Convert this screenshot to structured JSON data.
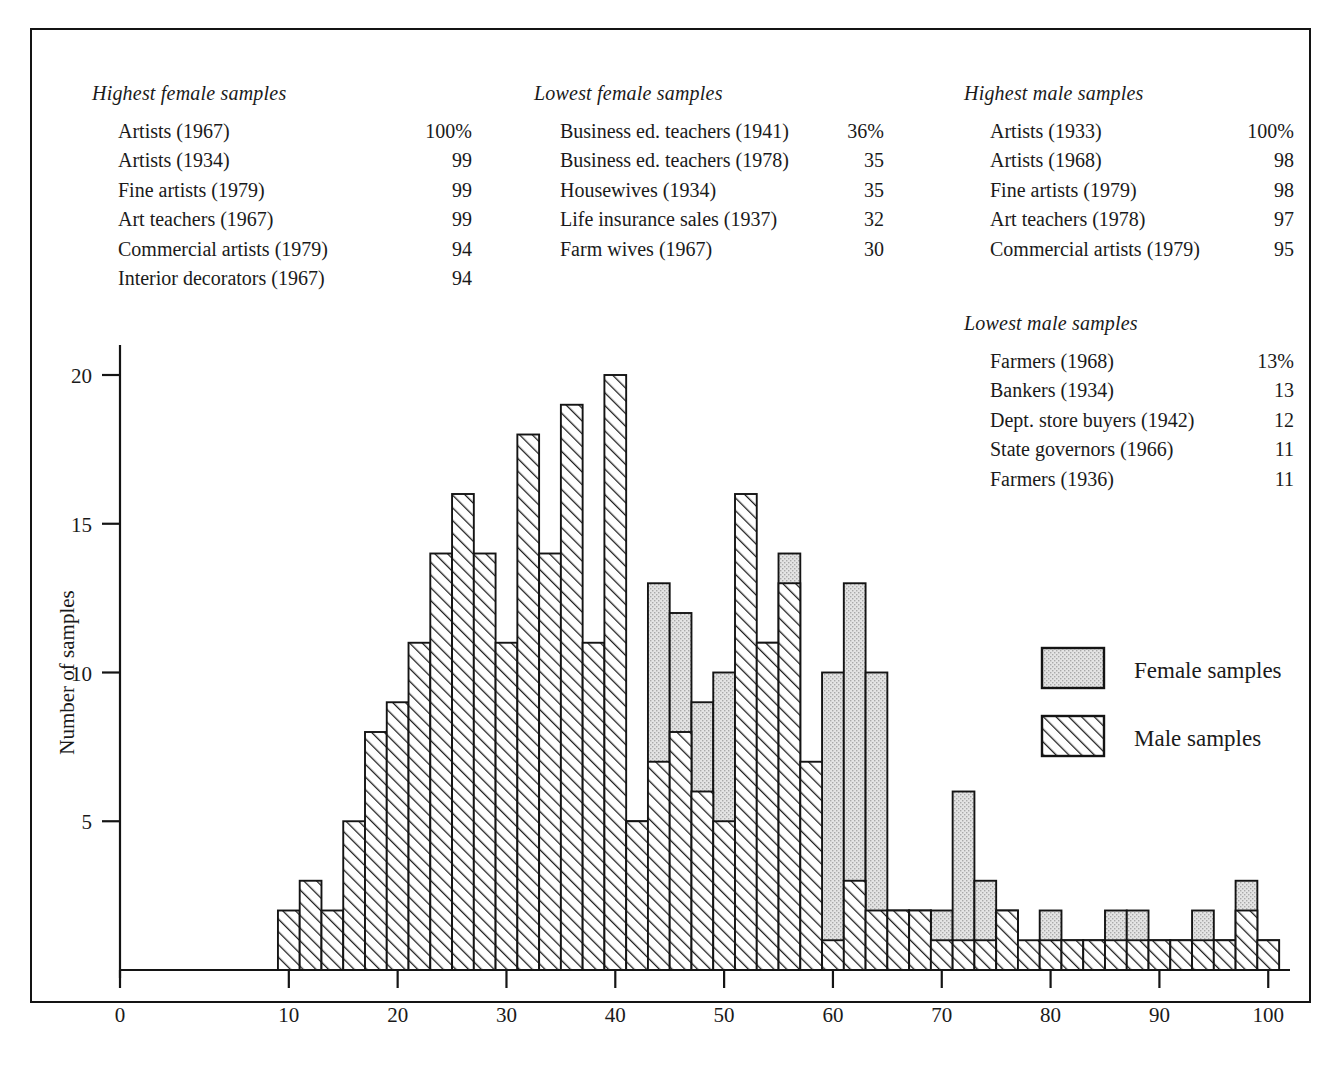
{
  "figure": {
    "blocks": [
      {
        "id": "highest-female",
        "title": "Highest female samples",
        "rows": [
          {
            "label": "Artists (1967)",
            "value": "100%"
          },
          {
            "label": "Artists (1934)",
            "value": "99"
          },
          {
            "label": "Fine artists (1979)",
            "value": "99"
          },
          {
            "label": "Art teachers (1967)",
            "value": "99"
          },
          {
            "label": "Commercial artists (1979)",
            "value": "94"
          },
          {
            "label": "Interior decorators (1967)",
            "value": "94"
          }
        ]
      },
      {
        "id": "lowest-female",
        "title": "Lowest female samples",
        "rows": [
          {
            "label": "Business ed. teachers (1941)",
            "value": "36%"
          },
          {
            "label": "Business ed. teachers (1978)",
            "value": "35"
          },
          {
            "label": "Housewives (1934)",
            "value": "35"
          },
          {
            "label": "Life insurance sales (1937)",
            "value": "32"
          },
          {
            "label": "Farm wives (1967)",
            "value": "30"
          }
        ]
      },
      {
        "id": "highest-male",
        "title": "Highest male samples",
        "rows": [
          {
            "label": "Artists (1933)",
            "value": "100%"
          },
          {
            "label": "Artists (1968)",
            "value": "98"
          },
          {
            "label": "Fine artists (1979)",
            "value": "98"
          },
          {
            "label": "Art teachers (1978)",
            "value": "97"
          },
          {
            "label": "Commercial artists (1979)",
            "value": "95"
          }
        ]
      },
      {
        "id": "lowest-male",
        "title": "Lowest male samples",
        "rows": [
          {
            "label": "Farmers (1968)",
            "value": "13%"
          },
          {
            "label": "Bankers (1934)",
            "value": "13"
          },
          {
            "label": "Dept. store buyers (1942)",
            "value": "12"
          },
          {
            "label": "State governors (1966)",
            "value": "11"
          },
          {
            "label": "Farmers (1936)",
            "value": "11"
          }
        ]
      }
    ]
  },
  "chart_data": {
    "type": "bar",
    "title": "",
    "xlabel": "Percent \"Like\" responses",
    "ylabel": "Number of samples",
    "xlim": [
      0,
      102
    ],
    "ylim": [
      0,
      20
    ],
    "xticks": [
      0,
      10,
      20,
      30,
      40,
      50,
      60,
      70,
      80,
      90,
      100
    ],
    "yticks": [
      0,
      5,
      10,
      15,
      20
    ],
    "grid": false,
    "bin_width": 2,
    "bin_starts": [
      9,
      11,
      13,
      15,
      17,
      19,
      21,
      23,
      25,
      27,
      29,
      31,
      33,
      35,
      37,
      39,
      41,
      43,
      45,
      47,
      49,
      51,
      53,
      55,
      57,
      59,
      61,
      63,
      65,
      67,
      69,
      71,
      73,
      75,
      77,
      79,
      81,
      83,
      85,
      87,
      89,
      91,
      93,
      95,
      97,
      99
    ],
    "legend": {
      "position": "inside-right",
      "entries": [
        {
          "name": "Female samples",
          "pattern": "stipple",
          "color": "#d6d6d6"
        },
        {
          "name": "Male samples",
          "pattern": "diagonal-hatch",
          "color": "#ffffff"
        }
      ]
    },
    "series": [
      {
        "name": "Male samples",
        "pattern": "diagonal-hatch",
        "values": [
          2,
          3,
          2,
          5,
          8,
          9,
          11,
          14,
          16,
          14,
          11,
          18,
          14,
          19,
          11,
          20,
          5,
          7,
          8,
          6,
          5,
          16,
          11,
          13,
          7,
          1,
          3,
          2,
          2,
          2,
          1,
          1,
          1,
          2,
          1,
          1,
          1,
          1,
          1,
          1,
          1,
          1,
          1,
          1,
          2,
          1
        ]
      },
      {
        "name": "Female samples",
        "pattern": "stipple",
        "values": [
          0,
          0,
          0,
          0,
          0,
          0,
          0,
          0,
          0,
          0,
          1,
          1,
          2,
          2,
          2,
          4,
          5,
          13,
          12,
          9,
          10,
          10,
          11,
          14,
          5,
          10,
          13,
          10,
          2,
          2,
          2,
          6,
          3,
          2,
          0,
          2,
          1,
          1,
          2,
          2,
          1,
          1,
          2,
          1,
          3,
          1
        ]
      }
    ]
  }
}
